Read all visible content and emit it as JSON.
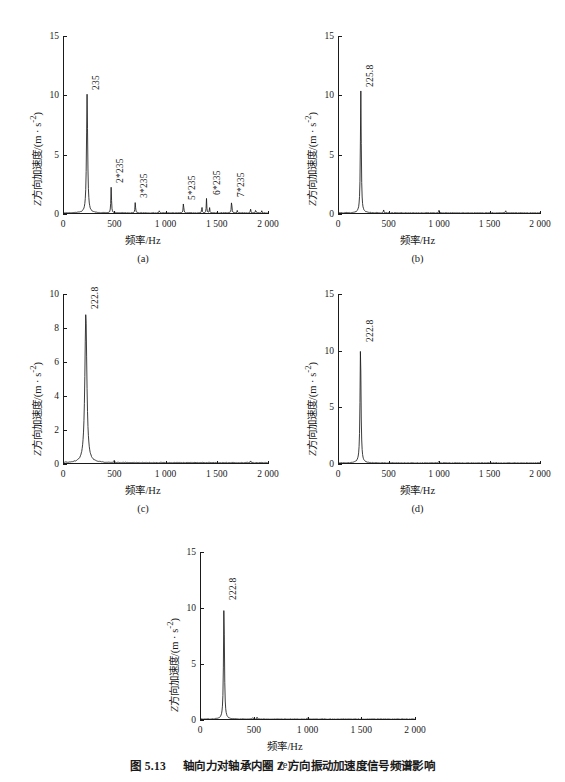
{
  "figure": {
    "caption_number": "图 5.13",
    "caption_text": "轴向力对轴承内圈 Z 方向振动加速度信号频谱影响",
    "axis_label_x": "频率/Hz",
    "axis_label_y_prefix": "Z",
    "axis_label_y_rest": "方向加速度/(m · s",
    "axis_label_y_exp": "-2",
    "axis_label_y_close": ")"
  },
  "chart_data": [
    {
      "id": "a",
      "type": "line",
      "sublabel": "(a)",
      "title": "",
      "xlabel": "频率/Hz",
      "ylabel": "Z方向加速度/(m · s⁻²)",
      "xlim": [
        0,
        2000
      ],
      "ylim": [
        0,
        15
      ],
      "xticks": [
        0,
        500,
        1000,
        1500,
        2000
      ],
      "xticklabels": [
        "0",
        "500",
        "1 000",
        "1 500",
        "2 000"
      ],
      "yticks": [
        0,
        5,
        10,
        15
      ],
      "yticklabels": [
        "0",
        "5",
        "10",
        "15"
      ],
      "grid": false,
      "legend": false,
      "annotations": [
        {
          "label": "235",
          "x": 235,
          "y": 10.0
        },
        {
          "label": "2*235",
          "x": 470,
          "y": 2.2
        },
        {
          "label": "3*235",
          "x": 705,
          "y": 0.9
        },
        {
          "label": "5*235",
          "x": 1175,
          "y": 0.8
        },
        {
          "label": "6*235",
          "x": 1410,
          "y": 1.2
        },
        {
          "label": "7*235",
          "x": 1645,
          "y": 1.0
        }
      ],
      "peaks": [
        {
          "x": 235,
          "y": 10.0,
          "w": 9
        },
        {
          "x": 470,
          "y": 2.2,
          "w": 5
        },
        {
          "x": 705,
          "y": 0.9,
          "w": 5
        },
        {
          "x": 940,
          "y": 0.18,
          "w": 5
        },
        {
          "x": 1175,
          "y": 0.8,
          "w": 5
        },
        {
          "x": 1355,
          "y": 0.55,
          "w": 4
        },
        {
          "x": 1400,
          "y": 1.2,
          "w": 4
        },
        {
          "x": 1430,
          "y": 0.45,
          "w": 4
        },
        {
          "x": 1645,
          "y": 1.0,
          "w": 5
        },
        {
          "x": 1700,
          "y": 0.2,
          "w": 4
        },
        {
          "x": 1830,
          "y": 0.3,
          "w": 5
        },
        {
          "x": 1880,
          "y": 0.25,
          "w": 5
        },
        {
          "x": 1940,
          "y": 0.18,
          "w": 5
        }
      ],
      "baseline": 0.07
    },
    {
      "id": "b",
      "type": "line",
      "sublabel": "(b)",
      "title": "",
      "xlabel": "频率/Hz",
      "ylabel": "Z方向加速度/(m · s⁻²)",
      "xlim": [
        0,
        2000
      ],
      "ylim": [
        0,
        15
      ],
      "xticks": [
        0,
        500,
        1000,
        1500,
        2000
      ],
      "xticklabels": [
        "0",
        "500",
        "1 000",
        "1 500",
        "2 000"
      ],
      "yticks": [
        0,
        5,
        10,
        15
      ],
      "yticklabels": [
        "0",
        "5",
        "10",
        "15"
      ],
      "grid": false,
      "legend": false,
      "annotations": [
        {
          "label": "225.8",
          "x": 225.8,
          "y": 10.3
        }
      ],
      "peaks": [
        {
          "x": 226,
          "y": 10.3,
          "w": 7
        },
        {
          "x": 452,
          "y": 0.25,
          "w": 5
        },
        {
          "x": 1000,
          "y": 0.2,
          "w": 5
        },
        {
          "x": 1660,
          "y": 0.2,
          "w": 5
        }
      ],
      "baseline": 0.07
    },
    {
      "id": "c",
      "type": "line",
      "sublabel": "(c)",
      "title": "",
      "xlabel": "频率/Hz",
      "ylabel": "Z方向加速度/(m · s⁻²)",
      "xlim": [
        0,
        2000
      ],
      "ylim": [
        0,
        10
      ],
      "xticks": [
        0,
        500,
        1000,
        1500,
        2000
      ],
      "xticklabels": [
        "0",
        "500",
        "1 000",
        "1 500",
        "2 000"
      ],
      "yticks": [
        0,
        2,
        4,
        6,
        8,
        10
      ],
      "yticklabels": [
        "0",
        "2",
        "4",
        "6",
        "8",
        "10"
      ],
      "grid": false,
      "legend": false,
      "annotations": [
        {
          "label": "222.8",
          "x": 222.8,
          "y": 8.8
        }
      ],
      "peaks": [
        {
          "x": 223,
          "y": 8.8,
          "w": 16
        },
        {
          "x": 500,
          "y": 0.12,
          "w": 5
        },
        {
          "x": 1830,
          "y": 0.12,
          "w": 5
        }
      ],
      "baseline": 0.06
    },
    {
      "id": "d",
      "type": "line",
      "sublabel": "(d)",
      "title": "",
      "xlabel": "频率/Hz",
      "ylabel": "Z方向加速度/(m · s⁻²)",
      "xlim": [
        0,
        2000
      ],
      "ylim": [
        0,
        15
      ],
      "xticks": [
        0,
        500,
        1000,
        1500,
        2000
      ],
      "xticklabels": [
        "0",
        "500",
        "1 000",
        "1 500",
        "2 000"
      ],
      "yticks": [
        0,
        5,
        10,
        15
      ],
      "yticklabels": [
        "0",
        "5",
        "10",
        "15"
      ],
      "grid": false,
      "legend": false,
      "annotations": [
        {
          "label": "222.8",
          "x": 222.8,
          "y": 10.3
        }
      ],
      "peaks": [
        {
          "x": 223,
          "y": 10.3,
          "w": 8
        },
        {
          "x": 1000,
          "y": 0.15,
          "w": 5
        }
      ],
      "baseline": 0.07
    },
    {
      "id": "e",
      "type": "line",
      "sublabel": "(e)",
      "title": "",
      "xlabel": "频率/Hz",
      "ylabel": "Z方向加速度/(m · s⁻²)",
      "xlim": [
        0,
        2000
      ],
      "ylim": [
        0,
        15
      ],
      "xticks": [
        0,
        500,
        1000,
        1500,
        2000
      ],
      "xticklabels": [
        "0",
        "500",
        "1 000",
        "1 500",
        "2 000"
      ],
      "yticks": [
        0,
        5,
        10,
        15
      ],
      "yticklabels": [
        "0",
        "5",
        "10",
        "15"
      ],
      "grid": false,
      "legend": false,
      "annotations": [
        {
          "label": "222.8",
          "x": 222.8,
          "y": 10.3
        }
      ],
      "peaks": [
        {
          "x": 223,
          "y": 10.3,
          "w": 7
        },
        {
          "x": 490,
          "y": 0.15,
          "w": 5
        },
        {
          "x": 530,
          "y": 0.15,
          "w": 5
        },
        {
          "x": 1000,
          "y": 0.12,
          "w": 5
        }
      ],
      "baseline": 0.06
    }
  ],
  "colors": {
    "ink": "#1a1a1a",
    "background": "#ffffff"
  }
}
